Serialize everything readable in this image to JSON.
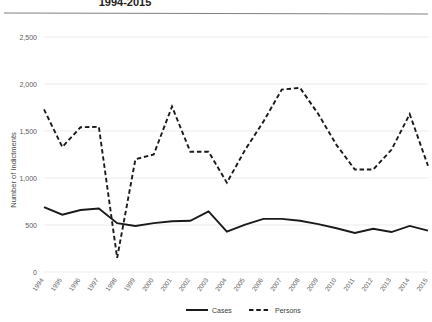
{
  "chart_data": {
    "type": "line",
    "title": "1994-2015",
    "xlabel": "",
    "ylabel": "Number of Indictments",
    "x": [
      1994,
      1995,
      1996,
      1997,
      1998,
      1999,
      2000,
      2001,
      2002,
      2003,
      2004,
      2005,
      2006,
      2007,
      2008,
      2009,
      2010,
      2011,
      2012,
      2013,
      2014,
      2015
    ],
    "categories": [
      "1994",
      "1995",
      "1996",
      "1997",
      "1998",
      "1999",
      "2000",
      "2001",
      "2002",
      "2003",
      "2004",
      "2005",
      "2006",
      "2007",
      "2008",
      "2009",
      "2010",
      "2011",
      "2012",
      "2013",
      "2014",
      "2015"
    ],
    "series": [
      {
        "name": "Cases",
        "style": "solid",
        "color": "#1a1a1a",
        "values": [
          690,
          610,
          660,
          675,
          520,
          490,
          520,
          540,
          545,
          645,
          430,
          505,
          565,
          565,
          545,
          510,
          465,
          415,
          460,
          425,
          490,
          440
        ]
      },
      {
        "name": "Persons",
        "style": "dashed",
        "color": "#1a1a1a",
        "values": [
          1730,
          1330,
          1540,
          1545,
          150,
          1200,
          1250,
          1760,
          1280,
          1280,
          950,
          1300,
          1600,
          1940,
          1960,
          1680,
          1350,
          1090,
          1090,
          1300,
          1680,
          1130
        ]
      }
    ],
    "ylim": [
      0,
      2500
    ],
    "yticks": [
      0,
      500,
      1000,
      1500,
      2000,
      2500
    ],
    "ytick_labels": [
      "0",
      "500",
      "1,000",
      "1,500",
      "2,000",
      "2,500"
    ],
    "grid": true,
    "legend_position": "bottom"
  },
  "legend": {
    "items": [
      {
        "label": "Cases",
        "style": "solid"
      },
      {
        "label": "Persons",
        "style": "dashed"
      }
    ]
  }
}
